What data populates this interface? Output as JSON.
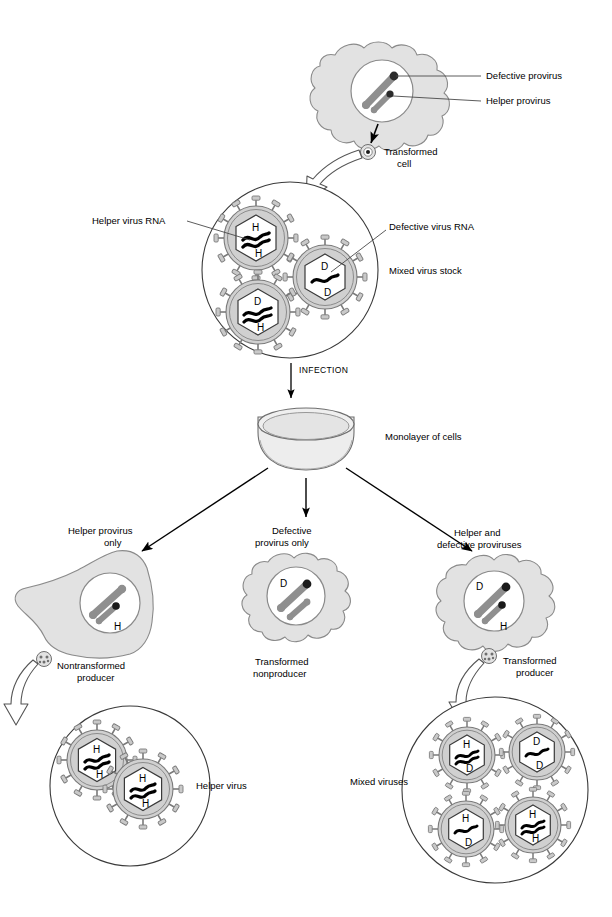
{
  "figure": {
    "colors": {
      "cytoplasm_fill": "#e2e2e2",
      "cytoplasm_stroke": "#8a8a8a",
      "nucleus_fill": "#ffffff",
      "nucleus_stroke": "#8a8a8a",
      "provirus_rod": "#8f8f8f",
      "provirus_bead": "#1a1a1a",
      "envelope_fill": "#d0d0d0",
      "envelope_stroke": "#7a7a7a",
      "capsid_fill": "#ffffff",
      "capsid_stroke": "#3a3a3a",
      "rna_stroke": "#000000",
      "spike_fill": "#c9c9c9",
      "dish_fill": "#e8e8e8",
      "dish_stroke": "#6f6f6f",
      "arrow_solid": "#000000",
      "arrow_hollow_stroke": "#555555",
      "leader_line": "#4a4a4a",
      "circle_stroke": "#3a3a3a"
    }
  },
  "labels": {
    "defective_provirus": "Defective provirus",
    "helper_provirus": "Helper provirus",
    "transformed_cell_line1": "Transformed",
    "transformed_cell_line2": "cell",
    "helper_virus_rna": "Helper virus RNA",
    "defective_virus_rna": "Defective virus RNA",
    "mixed_virus_stock": "Mixed virus stock",
    "infection": "INFECTION",
    "monolayer_of_cells": "Monolayer of cells",
    "helper_only_line1": "Helper provirus",
    "helper_only_line2": "only",
    "defective_only_line1": "Defective",
    "defective_only_line2": "provirus only",
    "both_line1": "Helper and",
    "both_line2": "defective proviruses",
    "nontransformed_producer_line1": "Nontransformed",
    "nontransformed_producer_line2": "producer",
    "transformed_nonproducer_line1": "Transformed",
    "transformed_nonproducer_line2": "nonproducer",
    "transformed_producer_line1": "Transformed",
    "transformed_producer_line2": "producer",
    "helper_virus": "Helper virus",
    "mixed_viruses": "Mixed viruses"
  },
  "virions": {
    "stock": [
      {
        "id": "stock-helper",
        "top": "H",
        "bottom": "H"
      },
      {
        "id": "stock-defective",
        "top": "D",
        "bottom": "D"
      },
      {
        "id": "stock-mixed",
        "top": "D",
        "bottom": "H"
      }
    ],
    "helper_virus_pool": [
      {
        "id": "hv-1",
        "top": "H",
        "bottom": "H"
      },
      {
        "id": "hv-2",
        "top": "H",
        "bottom": "H"
      }
    ],
    "mixed_virus_pool": [
      {
        "id": "mv-1",
        "top": "H",
        "bottom": "D"
      },
      {
        "id": "mv-2",
        "top": "D",
        "bottom": "D"
      },
      {
        "id": "mv-3",
        "top": "H",
        "bottom": "D"
      },
      {
        "id": "mv-4",
        "top": "H",
        "bottom": "H"
      }
    ]
  },
  "nuclei": {
    "top_cell": {
      "large_label": "",
      "small_label": ""
    },
    "nontransformed_producer": {
      "large_label": "",
      "small_label": "H"
    },
    "transformed_nonproducer": {
      "large_label": "D",
      "small_label": ""
    },
    "transformed_producer": {
      "large_label": "D",
      "small_label": "H"
    }
  }
}
